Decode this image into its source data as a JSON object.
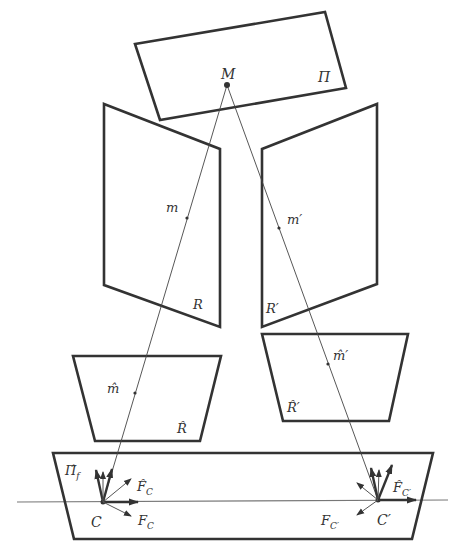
{
  "figure": {
    "planes": {
      "world": {
        "label": "Π",
        "point_label": "M"
      },
      "left_image": {
        "label": "R",
        "point_label": "m"
      },
      "right_image": {
        "label": "R′",
        "point_label": "m′"
      },
      "left_rectified": {
        "label": "R̂",
        "point_label": "m̂"
      },
      "right_rectified": {
        "label": "R̂′",
        "point_label": "m̂′"
      },
      "focal": {
        "label": "Π̂",
        "label_sub": "f"
      }
    },
    "cameras": {
      "left": {
        "center_label": "C",
        "frame_label": "F",
        "frame_sub": "C",
        "rect_frame_label": "F̂",
        "rect_frame_sub": "C"
      },
      "right": {
        "center_label": "C′",
        "frame_label": "F",
        "frame_sub": "C′",
        "rect_frame_label": "F̂",
        "rect_frame_sub": "C′"
      }
    }
  }
}
